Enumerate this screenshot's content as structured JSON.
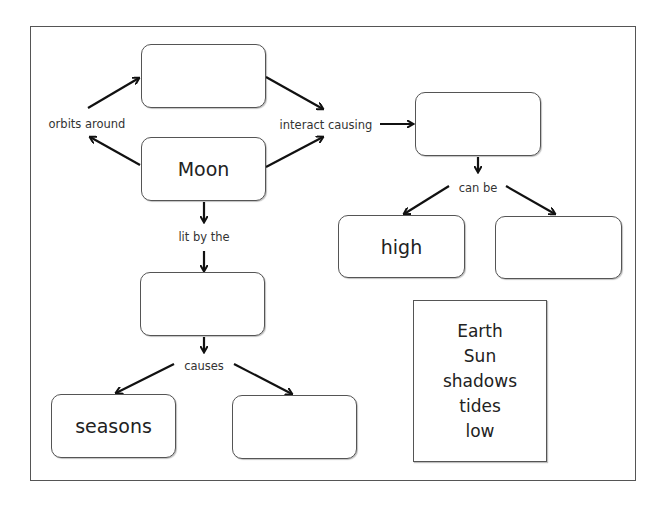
{
  "diagram": {
    "type": "concept-map",
    "nodes": {
      "top_blank": "",
      "moon": "Moon",
      "tides_blank": "",
      "light_blank": "",
      "high": "high",
      "tide_right_blank": "",
      "seasons": "seasons",
      "bottom_right_blank": ""
    },
    "links": {
      "orbits_around": "orbits around",
      "interact_causing": "interact causing",
      "lit_by_the": "lit by the",
      "can_be": "can be",
      "causes": "causes"
    },
    "word_bank": [
      "Earth",
      "Sun",
      "shadows",
      "tides",
      "low"
    ]
  }
}
